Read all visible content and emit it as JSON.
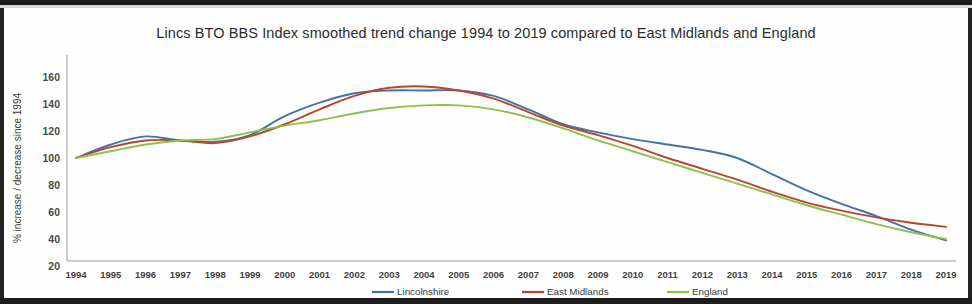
{
  "chart_data": {
    "type": "line",
    "title": "Lincs BTO BBS Index smoothed trend change 1994 to 2019 compared to East Midlands and England",
    "xlabel": "",
    "ylabel": "% increase / decrease since 1994",
    "ylim": [
      20,
      160
    ],
    "ytick_labels": [
      "160",
      "140",
      "120",
      "100",
      "80",
      "60",
      "40",
      "20"
    ],
    "yticks": [
      160,
      140,
      120,
      100,
      80,
      60,
      40,
      20
    ],
    "grid": false,
    "legend_position": "bottom",
    "categories": [
      1994,
      1995,
      1996,
      1997,
      1998,
      1999,
      2000,
      2001,
      2002,
      2003,
      2004,
      2005,
      2006,
      2007,
      2008,
      2009,
      2010,
      2011,
      2012,
      2013,
      2014,
      2015,
      2016,
      2017,
      2018,
      2019
    ],
    "xtick_labels": [
      "1994",
      "1995",
      "1996",
      "1997",
      "1998",
      "1999",
      "2000",
      "2001",
      "2002",
      "2003",
      "2004",
      "2005",
      "2006",
      "2007",
      "2008",
      "2009",
      "2010",
      "2011",
      "2012",
      "2013",
      "2014",
      "2015",
      "2016",
      "2017",
      "2018",
      "2019"
    ],
    "series": [
      {
        "name": "Lincolnshire",
        "color": "#4a6fa5",
        "values": [
          100,
          110,
          116,
          113,
          112,
          117,
          131,
          141,
          148,
          150,
          150,
          150,
          146,
          136,
          125,
          119,
          114,
          110,
          106,
          100,
          88,
          76,
          66,
          57,
          47,
          39
        ]
      },
      {
        "name": "East Midlands",
        "color": "#b5472f",
        "values": [
          100,
          108,
          113,
          113,
          111,
          116,
          125,
          136,
          146,
          152,
          153,
          150,
          144,
          134,
          124,
          117,
          109,
          100,
          92,
          84,
          75,
          67,
          61,
          56,
          52,
          49
        ]
      },
      {
        "name": "England",
        "color": "#8ec04b",
        "values": [
          100,
          105,
          110,
          113,
          114,
          119,
          124,
          128,
          133,
          137,
          139,
          139,
          136,
          130,
          122,
          113,
          105,
          97,
          89,
          81,
          73,
          65,
          58,
          51,
          45,
          40
        ]
      }
    ]
  },
  "legend": {
    "items": [
      {
        "label": "Lincolnshire"
      },
      {
        "label": "East Midlands"
      },
      {
        "label": "England"
      }
    ]
  }
}
